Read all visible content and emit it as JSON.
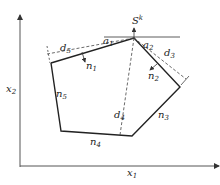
{
  "diagram": {
    "axes": {
      "x_label": "x",
      "x_sub": "1",
      "y_label": "x",
      "y_sub": "2"
    },
    "point_label": {
      "main": "S",
      "sup": "k"
    },
    "normals": [
      {
        "main": "n",
        "sub": "1"
      },
      {
        "main": "n",
        "sub": "2"
      },
      {
        "main": "n",
        "sub": "3"
      },
      {
        "main": "n",
        "sub": "4"
      },
      {
        "main": "n",
        "sub": "5"
      }
    ],
    "distances": [
      {
        "main": "d",
        "sub": "3"
      },
      {
        "main": "d",
        "sub": "4"
      },
      {
        "main": "d",
        "sub": "5"
      }
    ],
    "angles": [
      {
        "main": "a",
        "sub": "1"
      },
      {
        "main": "a",
        "sub": "2"
      }
    ],
    "colors": {
      "line": "#222222",
      "dashed": "#444444"
    }
  }
}
